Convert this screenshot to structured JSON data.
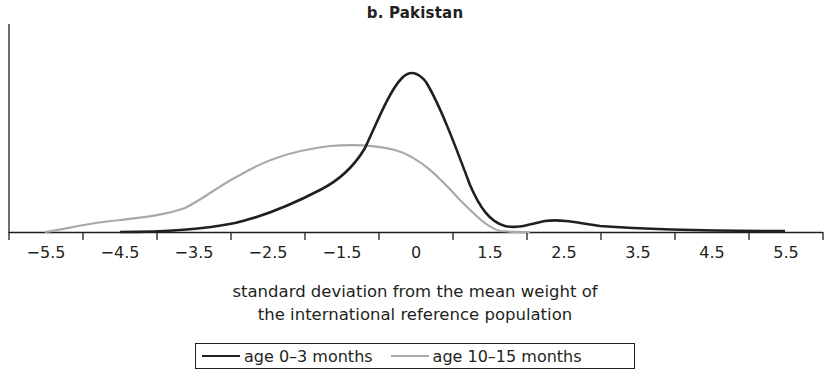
{
  "chart_data": {
    "type": "line",
    "title": "b. Pakistan",
    "xlabel": "standard deviation from the mean weight of the international reference population",
    "xlabel_lines": [
      "standard deviation from the mean weight of",
      "the international reference population"
    ],
    "ylabel": "",
    "x_tick_labels": [
      "−5.5",
      "−4.5",
      "−3.5",
      "−2.5",
      "−1.5",
      "0",
      "1.5",
      "2.5",
      "3.5",
      "4.5",
      "5.5"
    ],
    "grid": false,
    "y_axis_ticks": false,
    "legend_position": "bottom-center",
    "series": [
      {
        "name": "age 0–3 months",
        "color": "#231f20",
        "points_xy": [
          [
            -4.5,
            0.0
          ],
          [
            -3.5,
            0.02
          ],
          [
            -3.0,
            0.08
          ],
          [
            -2.5,
            0.2
          ],
          [
            -2.0,
            0.35
          ],
          [
            -1.5,
            0.55
          ],
          [
            -1.2,
            0.72
          ],
          [
            -0.9,
            0.9
          ],
          [
            -0.5,
            1.0
          ],
          [
            -0.2,
            0.96
          ],
          [
            0.2,
            0.78
          ],
          [
            0.5,
            0.46
          ],
          [
            0.8,
            0.17
          ],
          [
            1.1,
            0.04
          ],
          [
            1.5,
            0.02
          ],
          [
            1.8,
            0.06
          ],
          [
            2.2,
            0.07
          ],
          [
            2.7,
            0.04
          ],
          [
            3.8,
            0.01
          ],
          [
            5.5,
            0.0
          ]
        ],
        "peak": {
          "x": 0,
          "relative_height": 1.0
        }
      },
      {
        "name": "age 10–15 months",
        "color": "#a7a9ac",
        "points_xy": [
          [
            -5.5,
            0.0
          ],
          [
            -5.0,
            0.05
          ],
          [
            -4.5,
            0.08
          ],
          [
            -3.9,
            0.11
          ],
          [
            -3.5,
            0.15
          ],
          [
            -3.1,
            0.24
          ],
          [
            -2.7,
            0.35
          ],
          [
            -2.3,
            0.43
          ],
          [
            -1.8,
            0.51
          ],
          [
            -1.3,
            0.54
          ],
          [
            -0.9,
            0.55
          ],
          [
            -0.5,
            0.53
          ],
          [
            -0.1,
            0.47
          ],
          [
            0.3,
            0.33
          ],
          [
            0.7,
            0.17
          ],
          [
            1.0,
            0.04
          ],
          [
            1.3,
            0.0
          ],
          [
            1.6,
            0.0
          ]
        ],
        "peak": {
          "x": -1.2,
          "relative_height": 0.55
        }
      }
    ]
  },
  "plot_pixels": {
    "x_ticks_px": [
      9,
      83,
      157,
      231,
      305,
      379,
      453,
      527,
      601,
      675,
      749,
      823
    ],
    "label_centers_px": [
      46,
      120,
      194,
      268,
      342,
      416,
      490,
      564,
      638,
      712,
      786
    ],
    "dark_path": "M120,232 C160,232 200,230 235,223 C265,216 295,203 320,190 C340,180 355,165 365,148 C378,120 390,90 402,78 C410,70 418,72 426,82 C440,105 455,145 470,185 C480,208 490,222 505,226 C518,229 530,224 545,221 C560,219 575,222 600,226 C640,229 700,231 785,231",
    "light_path": "M45,232 C70,228 95,222 120,220 C145,217 165,215 185,208 C205,198 220,185 240,175 C265,160 295,150 330,146 C355,144 375,145 395,150 C420,157 440,178 460,200 C475,215 488,228 500,231 C510,232 520,232 530,232"
  },
  "legend": {
    "items": [
      {
        "label": "age 0–3 months"
      },
      {
        "label": "age 10–15 months"
      }
    ]
  }
}
